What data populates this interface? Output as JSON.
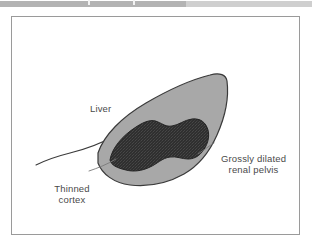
{
  "top_strip": {
    "name": "scanner-strip",
    "bands": [
      {
        "left": 0,
        "width": 186,
        "color": "#b3b3b3"
      },
      {
        "left": 186,
        "width": 126,
        "color": "#cfcfcf"
      }
    ],
    "ticks": [
      {
        "left": 88
      },
      {
        "left": 133
      }
    ]
  },
  "figure": {
    "frame_color": "#9a9a9a",
    "background": "#ffffff",
    "colors": {
      "cortex_fill": "#a8a8a8",
      "cortex_stroke": "#3a3a3a",
      "pelvis_fill": "#2f2f2f",
      "pelvis_texture": "#4a4a4a",
      "liver_edge_stroke": "#3a3a3a",
      "leader_line": "#6e6e6e",
      "label_text": "#4a4a4a"
    },
    "labels": {
      "liver": "Liver",
      "grossly_dilated_line1": "Grossly dilated",
      "grossly_dilated_line2": "renal pelvis",
      "thinned_line1": "Thinned",
      "thinned_line2": "cortex"
    }
  }
}
